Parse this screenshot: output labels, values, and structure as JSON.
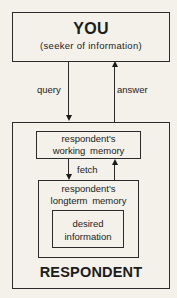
{
  "diagram": {
    "you_box": {
      "title": "YOU",
      "subtitle": "(seeker of information)"
    },
    "arrows": {
      "query": "query",
      "answer": "answer",
      "fetch": "fetch"
    },
    "respondent_box": {
      "title": "RESPONDENT",
      "working_memory": {
        "line1": "respondent's",
        "line2": "working memory"
      },
      "longterm_memory": {
        "line1": "respondent's",
        "line2": "longterm memory"
      },
      "desired_information": {
        "line1": "desired",
        "line2": "information"
      }
    }
  }
}
